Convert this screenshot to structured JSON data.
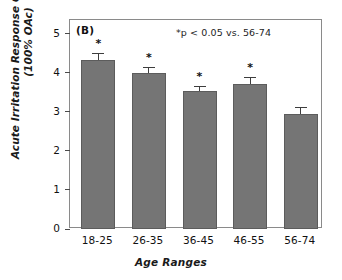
{
  "figure": {
    "panel_label": "(B)",
    "annotation": "*p < 0.05 vs. 56-74",
    "bar_color": "#757575",
    "bar_edge_color": "#5c5c5c",
    "axis_color": "#8a8a8a",
    "text_color": "#111111"
  },
  "chart_data": {
    "type": "bar",
    "title": "(B)",
    "xlabel": "Age Ranges",
    "ylabel": "Acute Irritation Response Grade (+ SE) (100% OAc)",
    "ylabel_line1": "Acute Irritation Response Grade (+ SE)",
    "ylabel_line2": "(100% OAc)",
    "categories": [
      "18-25",
      "26-35",
      "36-45",
      "46-55",
      "56-74"
    ],
    "values": [
      4.32,
      4.0,
      3.52,
      3.7,
      2.94
    ],
    "errors": [
      0.18,
      0.15,
      0.13,
      0.18,
      0.18
    ],
    "significance": [
      "*",
      "*",
      "*",
      "*",
      ""
    ],
    "ylim": [
      0,
      5.35
    ],
    "yticks": [
      0,
      1,
      2,
      3,
      4,
      5
    ],
    "ytick_labels": [
      "0",
      "1",
      "2",
      "3",
      "4",
      "5"
    ],
    "grid": false,
    "legend": "none",
    "annotations": [
      "*p < 0.05 vs. 56-74"
    ]
  }
}
